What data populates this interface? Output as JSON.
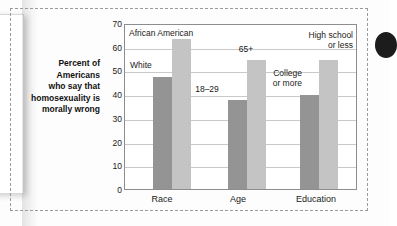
{
  "chart_data": {
    "type": "bar",
    "title": "",
    "xlabel": "",
    "ylabel": "Percent of Americans who say that homosexuality is morally wrong",
    "ylim": [
      0,
      70
    ],
    "ytick_step": 10,
    "yticks": [
      70,
      60,
      50,
      40,
      30,
      20,
      10,
      0
    ],
    "grid": true,
    "legend": "none (bars labeled in place)",
    "categories": [
      "Race",
      "Age",
      "Education"
    ],
    "bars": [
      {
        "group": "Race",
        "label": "White",
        "value": 48,
        "shade": "dark"
      },
      {
        "group": "Race",
        "label": "African American",
        "value": 64,
        "shade": "light"
      },
      {
        "group": "Age",
        "label": "18–29",
        "value": 38,
        "shade": "dark"
      },
      {
        "group": "Age",
        "label": "65+",
        "value": 55,
        "shade": "light"
      },
      {
        "group": "Education",
        "label": "College or more",
        "value": 40,
        "shade": "dark"
      },
      {
        "group": "Education",
        "label": "High school or less",
        "value": 55,
        "shade": "light"
      }
    ],
    "colors": {
      "dark_bar": "#949494",
      "light_bar": "#c4c4c4",
      "gridline": "#c9c9c9",
      "axis": "#8d8d8d"
    }
  },
  "axis_title_lines": [
    "Percent of",
    "Americans",
    "who say that",
    "homosexuality is",
    "morally wrong"
  ],
  "bar_labels": {
    "white": "White",
    "african_american": "African American",
    "age_young": "18–29",
    "age_old": "65+",
    "college": [
      "College",
      "or more"
    ],
    "highschool": [
      "High school",
      "or less"
    ]
  },
  "tick_labels": {
    "t70": "70",
    "t60": "60",
    "t50": "50",
    "t40": "40",
    "t30": "30",
    "t20": "20",
    "t10": "10",
    "t0": "0"
  },
  "category_labels": {
    "race": "Race",
    "age": "Age",
    "education": "Education"
  }
}
